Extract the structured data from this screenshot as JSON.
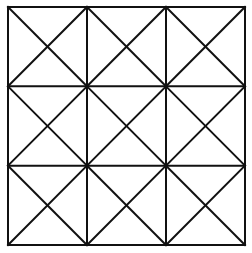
{
  "diagram": {
    "type": "grid-with-diagonals",
    "rows": 3,
    "cols": 3,
    "origin": {
      "x": 8,
      "y": 7
    },
    "extent": {
      "x": 245,
      "y": 245
    },
    "line_color": "#111111",
    "line_width": 2,
    "background": "#ffffff",
    "cells": [
      {
        "row": 0,
        "col": 0,
        "diagonals": [
          "tl-br",
          "tr-bl"
        ]
      },
      {
        "row": 0,
        "col": 1,
        "diagonals": [
          "tl-br",
          "tr-bl"
        ]
      },
      {
        "row": 0,
        "col": 2,
        "diagonals": [
          "tl-br",
          "tr-bl"
        ]
      },
      {
        "row": 1,
        "col": 0,
        "diagonals": [
          "tl-br",
          "tr-bl"
        ]
      },
      {
        "row": 1,
        "col": 1,
        "diagonals": [
          "tl-br",
          "tr-bl"
        ]
      },
      {
        "row": 1,
        "col": 2,
        "diagonals": [
          "tl-br",
          "tr-bl"
        ]
      },
      {
        "row": 2,
        "col": 0,
        "diagonals": [
          "tl-br",
          "tr-bl"
        ]
      },
      {
        "row": 2,
        "col": 1,
        "diagonals": [
          "tl-br",
          "tr-bl"
        ]
      },
      {
        "row": 2,
        "col": 2,
        "diagonals": [
          "tl-br",
          "tr-bl"
        ]
      }
    ]
  }
}
